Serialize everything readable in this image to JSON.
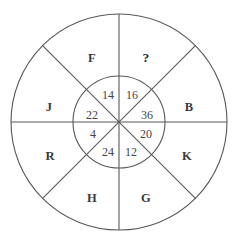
{
  "figure": {
    "type": "wheel-puzzle-diagram",
    "background_color": "#ffffff",
    "stroke_color": "#58585c",
    "text_color": "#3b3b40",
    "center": {
      "x": 119,
      "y": 122
    },
    "outer_radius": 108,
    "inner_radius": 46,
    "sector_count": 8
  },
  "outer_sectors": [
    {
      "key": "outer-top-right",
      "label": "?",
      "angle_deg": 67.5,
      "is_unknown": true,
      "x": 146,
      "y": 58
    },
    {
      "key": "outer-right-upper",
      "label": "B",
      "angle_deg": 22.5,
      "is_unknown": false,
      "x": 189,
      "y": 107
    },
    {
      "key": "outer-right-lower",
      "label": "K",
      "angle_deg": -22.5,
      "is_unknown": false,
      "x": 187,
      "y": 156
    },
    {
      "key": "outer-bottom-right",
      "label": "G",
      "angle_deg": -67.5,
      "is_unknown": false,
      "x": 146,
      "y": 198
    },
    {
      "key": "outer-bottom-left",
      "label": "H",
      "angle_deg": -112.5,
      "is_unknown": false,
      "x": 92,
      "y": 198
    },
    {
      "key": "outer-left-lower",
      "label": "R",
      "angle_deg": -157.5,
      "is_unknown": false,
      "x": 50,
      "y": 156
    },
    {
      "key": "outer-left-upper",
      "label": "J",
      "angle_deg": 157.5,
      "is_unknown": false,
      "x": 49,
      "y": 107
    },
    {
      "key": "outer-top-left",
      "label": "F",
      "angle_deg": 112.5,
      "is_unknown": false,
      "x": 92,
      "y": 58
    }
  ],
  "inner_sectors": [
    {
      "key": "inner-top-right",
      "value": "16",
      "angle_deg": 67.5,
      "x": 132,
      "y": 95
    },
    {
      "key": "inner-right-upper",
      "value": "36",
      "angle_deg": 22.5,
      "x": 147,
      "y": 115
    },
    {
      "key": "inner-right-lower",
      "value": "20",
      "angle_deg": -22.5,
      "x": 146,
      "y": 134
    },
    {
      "key": "inner-bottom-right",
      "value": "12",
      "angle_deg": -67.5,
      "x": 131,
      "y": 152
    },
    {
      "key": "inner-bottom-left",
      "value": "24",
      "angle_deg": -112.5,
      "x": 108,
      "y": 152
    },
    {
      "key": "inner-left-lower",
      "value": "4",
      "angle_deg": -157.5,
      "x": 93,
      "y": 134
    },
    {
      "key": "inner-left-upper",
      "value": "22",
      "angle_deg": 157.5,
      "x": 92,
      "y": 115
    },
    {
      "key": "inner-top-left",
      "value": "14",
      "angle_deg": 112.5,
      "x": 108,
      "y": 95
    }
  ],
  "dividers": [
    {
      "key": "divider-vertical",
      "x1": 119,
      "y1": 14,
      "x2": 119,
      "y2": 230
    },
    {
      "key": "divider-horizontal",
      "x1": 11,
      "y1": 122,
      "x2": 227,
      "y2": 122
    },
    {
      "key": "divider-diagonal-nwse",
      "x1": 42.6,
      "y1": 45.6,
      "x2": 195.4,
      "y2": 198.4
    },
    {
      "key": "divider-diagonal-nesw",
      "x1": 195.4,
      "y1": 45.6,
      "x2": 42.6,
      "y2": 198.4
    }
  ]
}
